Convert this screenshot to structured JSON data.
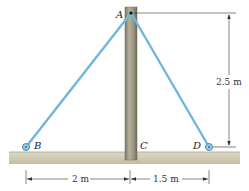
{
  "diagram": {
    "type": "statics-pole-with-cables",
    "points": {
      "A": {
        "label": "A"
      },
      "B": {
        "label": "B"
      },
      "C": {
        "label": "C"
      },
      "D": {
        "label": "D"
      }
    },
    "dimensions": {
      "height": "2.5 m",
      "left_span": "2 m",
      "right_span": "1.5 m"
    },
    "colors": {
      "cable": "#6fb6dc",
      "pole": "#9a9682",
      "ground": "#cfc9b3",
      "dimension_line": "#333333"
    }
  }
}
